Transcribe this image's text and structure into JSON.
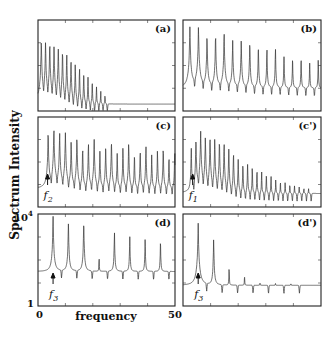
{
  "figure": {
    "ylabel": "Spectrum Intensity",
    "xlabel": "frequency",
    "y_top_tick": "10",
    "y_top_exp": "4",
    "y_bottom_tick": "1",
    "x_left_tick": "0",
    "x_right_tick": "50"
  },
  "panels": [
    {
      "id": "a",
      "label": "(a)",
      "annotation": null
    },
    {
      "id": "b",
      "label": "(b)",
      "annotation": null
    },
    {
      "id": "c",
      "label": "(c)",
      "annotation": {
        "symbol": "f",
        "sub": "2"
      }
    },
    {
      "id": "c-prime",
      "label": "(c')",
      "annotation": {
        "symbol": "f",
        "sub": "1"
      }
    },
    {
      "id": "d",
      "label": "(d)",
      "annotation": {
        "symbol": "f",
        "sub": "3"
      }
    },
    {
      "id": "d-prime",
      "label": "(d')",
      "annotation": {
        "symbol": "f",
        "sub": "3"
      }
    }
  ],
  "chart_data": [
    {
      "type": "line",
      "title": "(a)",
      "xlabel": "frequency",
      "ylabel": "Spectrum Intensity (log)",
      "xlim": [
        0,
        50
      ],
      "ylim": [
        1,
        10000
      ],
      "yscale": "log",
      "peaks": {
        "f0": 1.2,
        "spacing": 1.55,
        "count": 16,
        "heights_log10": [
          3.1,
          3.0,
          2.95,
          2.85,
          2.75,
          2.6,
          2.45,
          2.25,
          2.05,
          1.85,
          1.65,
          1.45,
          1.25,
          1.0,
          0.75,
          0.5
        ],
        "baseline_log10": 0.6
      }
    },
    {
      "type": "line",
      "title": "(b)",
      "xlabel": "frequency",
      "ylabel": "Spectrum Intensity (log)",
      "xlim": [
        0,
        50
      ],
      "ylim": [
        1,
        10000
      ],
      "yscale": "log",
      "peaks": {
        "f0": 2.5,
        "spacing": 3.1,
        "count": 16,
        "heights_log10": [
          3.7,
          3.7,
          3.3,
          3.3,
          3.4,
          3.1,
          3.1,
          3.0,
          2.8,
          2.7,
          2.7,
          2.4,
          2.3,
          2.3,
          2.1,
          2.2
        ],
        "baseline_log10": 1.3
      }
    },
    {
      "type": "line",
      "title": "(c)",
      "xlabel": "frequency",
      "ylabel": "Spectrum Intensity (log)",
      "xlim": [
        0,
        50
      ],
      "ylim": [
        1,
        10000
      ],
      "yscale": "log",
      "peaks": {
        "f0": 3.7,
        "spacing": 2.1,
        "count": 23,
        "heights_log10": [
          3.3,
          3.5,
          3.3,
          3.3,
          2.9,
          3.1,
          2.6,
          2.8,
          3.0,
          2.5,
          2.7,
          2.9,
          2.4,
          2.6,
          2.8,
          2.3,
          2.5,
          2.7,
          2.3,
          2.5,
          2.6,
          2.2,
          2.4
        ],
        "baseline_log10": 1.1
      },
      "annotations": [
        {
          "text": "f2",
          "x": 3.5
        }
      ]
    },
    {
      "type": "line",
      "title": "(c')",
      "xlabel": "frequency",
      "ylabel": "Spectrum Intensity (log)",
      "xlim": [
        0,
        50
      ],
      "ylim": [
        1,
        10000
      ],
      "yscale": "log",
      "peaks": {
        "f0": 3.0,
        "spacing": 1.7,
        "count": 26,
        "heights_log10": [
          2.6,
          3.0,
          3.4,
          3.1,
          3.1,
          3.0,
          2.9,
          2.8,
          2.6,
          2.4,
          2.1,
          1.9,
          1.9,
          1.7,
          1.6,
          1.5,
          1.4,
          1.3,
          1.1,
          1.0,
          0.9,
          0.8,
          0.7,
          0.6,
          0.5,
          0.4
        ],
        "baseline_log10": 0.9
      },
      "annotations": [
        {
          "text": "f1",
          "x": 3.5
        }
      ]
    },
    {
      "type": "line",
      "title": "(d)",
      "xlabel": "frequency",
      "ylabel": "Spectrum Intensity (log)",
      "xlim": [
        0,
        50
      ],
      "ylim": [
        1,
        10000
      ],
      "yscale": "log",
      "peaks": {
        "f0": 5.5,
        "spacing": 5.6,
        "count": 9,
        "heights_log10": [
          3.9,
          3.6,
          3.6,
          2.0,
          3.2,
          3.0,
          2.9,
          2.8,
          2.7
        ],
        "baseline_log10": 1.8
      },
      "annotations": [
        {
          "text": "f3",
          "x": 5.5
        }
      ]
    },
    {
      "type": "line",
      "title": "(d')",
      "xlabel": "frequency",
      "ylabel": "Spectrum Intensity (log)",
      "xlim": [
        0,
        50
      ],
      "ylim": [
        1,
        10000
      ],
      "yscale": "log",
      "peaks": {
        "f0": 5.5,
        "spacing": 5.6,
        "count": 7,
        "heights_log10": [
          3.6,
          2.9,
          1.6,
          1.1,
          0.3,
          0.2,
          0.1
        ],
        "baseline_log10": 1.2
      },
      "annotations": [
        {
          "text": "f3",
          "x": 5.5
        }
      ]
    }
  ]
}
